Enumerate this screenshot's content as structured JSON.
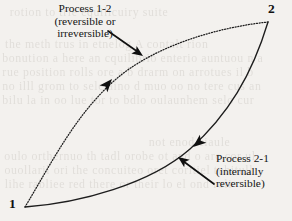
{
  "figure": {
    "background_color": "#f3f1ee",
    "ink_color": "#1a1a1a"
  },
  "states": [
    {
      "id": "1",
      "label": "1",
      "x": 25,
      "y": 207
    },
    {
      "id": "2",
      "label": "2",
      "x": 268,
      "y": 22
    }
  ],
  "annotations": {
    "process_1_2": {
      "line1": "Process 1-2",
      "line2": "(reversible or",
      "line3": "irreversible)"
    },
    "process_2_1": {
      "line1": "Process 2-1",
      "line2": "(internally",
      "line3": "reversible)"
    }
  },
  "chart_data": {
    "type": "line",
    "xlabel": "",
    "ylabel": "",
    "grid": false,
    "legend": "none",
    "series": [
      {
        "name": "Process 1-2 (reversible or irreversible)",
        "style": "dotted",
        "direction": "1 to 2",
        "points": [
          [
            25,
            207
          ],
          [
            60,
            148
          ],
          [
            103,
            90
          ],
          [
            158,
            48
          ],
          [
            220,
            29
          ],
          [
            268,
            22
          ]
        ]
      },
      {
        "name": "Process 2-1 (internally reversible)",
        "style": "solid",
        "direction": "2 to 1",
        "points": [
          [
            268,
            22
          ],
          [
            248,
            72
          ],
          [
            222,
            112
          ],
          [
            190,
            148
          ],
          [
            140,
            182
          ],
          [
            80,
            202
          ],
          [
            25,
            207
          ]
        ]
      }
    ],
    "flow_arrows": [
      {
        "on": "Process 1-2",
        "x": 112,
        "y": 79,
        "angle_deg": -49
      },
      {
        "on": "Process 2-1",
        "x": 196,
        "y": 143,
        "angle_deg": 140
      }
    ],
    "pointer_arrows": [
      {
        "from": [
          110,
          33
        ],
        "to": [
          143,
          56
        ],
        "targets": "Process 1-2 curve"
      },
      {
        "from": [
          213,
          183
        ],
        "to": [
          179,
          158
        ],
        "targets": "Process 2-1 curve"
      }
    ]
  },
  "ghost_text": [
    {
      "text": "rotion to trie equilicuiry suite",
      "x": 12,
      "y": 6
    },
    {
      "text": "the meth trus in etnelog  A  contalt rion",
      "x": 8,
      "y": 38
    },
    {
      "text": "bonution   a  here  an  cquilibrio  enterio  auntuou n a",
      "x": 6,
      "y": 52
    },
    {
      "text": "rue   position  rolls  ore  a  b  drarm   on  arrotues  il b",
      "x": 6,
      "y": 66
    },
    {
      "text": "no  illl  grom  to  sele  aino  d  muo  oo  no  tere  cus  an",
      "x": 6,
      "y": 80
    },
    {
      "text": "bilu  la  in  oo  lue  tor  to  bdlo  oulaunhem  selo  cur",
      "x": 6,
      "y": 94
    },
    {
      "text": "not enod ciaule",
      "x": 150,
      "y": 136
    },
    {
      "text": "oulo  orthernuo  th  tadl  orobe  ot  and  o  are  cor  ul",
      "x": 8,
      "y": 150
    },
    {
      "text": "ouollaril  ori  the  concuiteo  oret  coritiel  tubitull",
      "x": 8,
      "y": 164
    },
    {
      "text": "lihe  rabliee  red  there  or  their  lo  el  ond  roli",
      "x": 8,
      "y": 178
    }
  ]
}
